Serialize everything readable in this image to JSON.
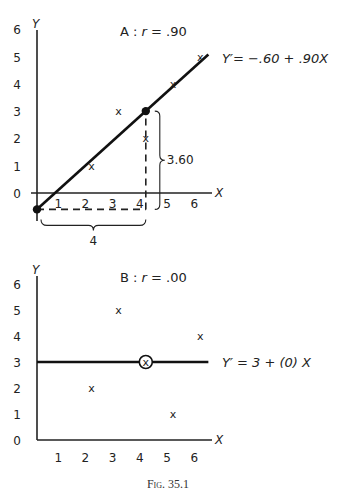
{
  "figure": {
    "caption": "Fig. 35.1"
  },
  "chart_data": [
    {
      "type": "scatter",
      "panel": "A",
      "title": "A : r = .90",
      "title_parts": {
        "panel": "A",
        "sep": ":",
        "r_symbol": "r",
        "r_value": "= .90"
      },
      "xlabel": "X",
      "ylabel": "Y",
      "xlim": [
        0,
        6
      ],
      "ylim": [
        0,
        6
      ],
      "x_ticks": [
        "1",
        "2",
        "3",
        "4",
        "5",
        "6"
      ],
      "y_ticks": [
        "0",
        "1",
        "2",
        "3",
        "4",
        "5",
        "6"
      ],
      "points": [
        {
          "x": 2,
          "y": 1,
          "marker": "x"
        },
        {
          "x": 3,
          "y": 3,
          "marker": "x"
        },
        {
          "x": 4,
          "y": 2,
          "marker": "x"
        },
        {
          "x": 5,
          "y": 4,
          "marker": "x"
        },
        {
          "x": 6,
          "y": 5,
          "marker": "x"
        }
      ],
      "regression_line": {
        "intercept": -0.6,
        "slope": 0.9,
        "x_range": [
          0,
          6.3
        ],
        "label": "Y′= −.60 + .90X"
      },
      "highlighted_points": [
        {
          "x": 0,
          "y": -0.6
        },
        {
          "x": 4,
          "y": 3.0
        }
      ],
      "annotations": {
        "run_label": "4",
        "rise_label": "3.60",
        "run_from": [
          0,
          -0.6
        ],
        "run_to": [
          4,
          -0.6
        ],
        "rise_from": [
          4,
          -0.6
        ],
        "rise_to": [
          4,
          3.0
        ]
      },
      "grid": false
    },
    {
      "type": "scatter",
      "panel": "B",
      "title": "B : r = .00",
      "title_parts": {
        "panel": "B",
        "sep": ":",
        "r_symbol": "r",
        "r_value": "= .00"
      },
      "xlabel": "X",
      "ylabel": "Y",
      "xlim": [
        0,
        6
      ],
      "ylim": [
        0,
        6
      ],
      "x_ticks": [
        "1",
        "2",
        "3",
        "4",
        "5",
        "6"
      ],
      "y_ticks": [
        "0",
        "1",
        "2",
        "3",
        "4",
        "5",
        "6"
      ],
      "points": [
        {
          "x": 2,
          "y": 2,
          "marker": "x"
        },
        {
          "x": 3,
          "y": 5,
          "marker": "x"
        },
        {
          "x": 4,
          "y": 3,
          "marker": "circled-x"
        },
        {
          "x": 5,
          "y": 1,
          "marker": "x"
        },
        {
          "x": 6,
          "y": 4,
          "marker": "x"
        }
      ],
      "regression_line": {
        "intercept": 3,
        "slope": 0,
        "x_range": [
          0,
          6.3
        ],
        "label": "Y′ = 3 + (0) X"
      },
      "grid": false
    }
  ]
}
